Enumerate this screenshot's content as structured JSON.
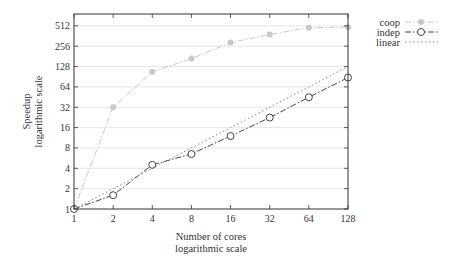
{
  "chart_data": {
    "type": "line",
    "title": "",
    "xlabel": "Number of cores",
    "xlabel_sub": "logarithmic scale",
    "ylabel": "Speedup",
    "ylabel_sub": "logarithmic scale",
    "x": [
      1,
      2,
      4,
      8,
      16,
      32,
      64,
      128
    ],
    "x_ticks": [
      "1",
      "2",
      "4",
      "8",
      "16",
      "32",
      "64",
      "128"
    ],
    "y_ticks": [
      "1",
      "2",
      "4",
      "8",
      "16",
      "32",
      "64",
      "128",
      "256",
      "512"
    ],
    "xscale": "log2",
    "yscale": "log2",
    "xlim": [
      1,
      128
    ],
    "ylim": [
      1,
      700
    ],
    "grid": "horizontal",
    "legend_position": "outside-top-right",
    "series": [
      {
        "name": "coop",
        "style": "dash-dot",
        "marker": "filled-circle",
        "color": "#c8c8c8",
        "values": [
          1,
          32,
          107,
          168,
          290,
          380,
          480,
          490
        ]
      },
      {
        "name": "indep",
        "style": "dash-dot",
        "marker": "open-circle",
        "color": "#444444",
        "values": [
          1,
          1.6,
          4.5,
          6.5,
          12,
          22.5,
          45,
          88
        ]
      },
      {
        "name": "linear",
        "style": "dotted",
        "marker": "none",
        "color": "#888888",
        "values": [
          1,
          2,
          4,
          8,
          16,
          32,
          64,
          128
        ]
      }
    ]
  }
}
